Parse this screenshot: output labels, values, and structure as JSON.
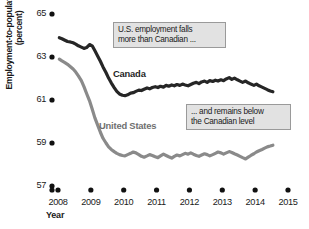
{
  "chart_data": {
    "type": "line",
    "title": "",
    "xlabel": "Year",
    "ylabel": "Employment-to-population ratio\n(percent)",
    "xlim": [
      2008.0,
      2015.0
    ],
    "ylim": [
      57,
      65
    ],
    "xticks": [
      "2008",
      "2009",
      "2010",
      "2011",
      "2012",
      "2013",
      "2014",
      "2015"
    ],
    "yticks": [
      "57",
      "59",
      "61",
      "63",
      "65"
    ],
    "grid": false,
    "legend_position": "inline-labels",
    "series": [
      {
        "name": "Canada",
        "color": "#262626",
        "label_position": "above-line",
        "x": [
          2008.04,
          2008.12,
          2008.21,
          2008.29,
          2008.37,
          2008.46,
          2008.54,
          2008.62,
          2008.71,
          2008.79,
          2008.87,
          2008.96,
          2009.04,
          2009.12,
          2009.21,
          2009.29,
          2009.37,
          2009.46,
          2009.54,
          2009.62,
          2009.71,
          2009.79,
          2009.87,
          2009.96,
          2010.04,
          2010.12,
          2010.21,
          2010.29,
          2010.37,
          2010.46,
          2010.54,
          2010.62,
          2010.71,
          2010.79,
          2010.87,
          2010.96,
          2011.04,
          2011.12,
          2011.21,
          2011.29,
          2011.37,
          2011.46,
          2011.54,
          2011.62,
          2011.71,
          2011.79,
          2011.87,
          2011.96,
          2012.04,
          2012.12,
          2012.21,
          2012.29,
          2012.37,
          2012.46,
          2012.54,
          2012.62,
          2012.71,
          2012.79,
          2012.87,
          2012.96,
          2013.04,
          2013.12,
          2013.21,
          2013.29,
          2013.37,
          2013.46,
          2013.54,
          2013.62,
          2013.71,
          2013.79,
          2013.87,
          2013.96,
          2014.04,
          2014.12,
          2014.21,
          2014.29,
          2014.37,
          2014.46,
          2014.54
        ],
        "values": [
          63.9,
          63.85,
          63.78,
          63.72,
          63.7,
          63.66,
          63.6,
          63.52,
          63.46,
          63.4,
          63.44,
          63.58,
          63.52,
          63.3,
          63.04,
          62.8,
          62.54,
          62.28,
          62.02,
          61.8,
          61.58,
          61.4,
          61.28,
          61.22,
          61.2,
          61.24,
          61.32,
          61.34,
          61.4,
          61.46,
          61.44,
          61.5,
          61.56,
          61.52,
          61.58,
          61.62,
          61.58,
          61.64,
          61.6,
          61.68,
          61.64,
          61.7,
          61.66,
          61.72,
          61.68,
          61.74,
          61.7,
          61.66,
          61.72,
          61.78,
          61.82,
          61.76,
          61.84,
          61.88,
          61.82,
          61.9,
          61.86,
          61.92,
          61.88,
          61.94,
          61.9,
          61.98,
          62.04,
          61.96,
          62.02,
          61.94,
          61.88,
          61.82,
          61.88,
          61.8,
          61.74,
          61.68,
          61.74,
          61.66,
          61.6,
          61.54,
          61.48,
          61.42,
          61.38
        ]
      },
      {
        "name": "United States",
        "color": "#8a8a8a",
        "label_position": "below-line",
        "x": [
          2008.04,
          2008.12,
          2008.21,
          2008.29,
          2008.37,
          2008.46,
          2008.54,
          2008.62,
          2008.71,
          2008.79,
          2008.87,
          2008.96,
          2009.04,
          2009.12,
          2009.21,
          2009.29,
          2009.37,
          2009.46,
          2009.54,
          2009.62,
          2009.71,
          2009.79,
          2009.87,
          2009.96,
          2010.04,
          2010.12,
          2010.21,
          2010.29,
          2010.37,
          2010.46,
          2010.54,
          2010.62,
          2010.71,
          2010.79,
          2010.87,
          2010.96,
          2011.04,
          2011.12,
          2011.21,
          2011.29,
          2011.37,
          2011.46,
          2011.54,
          2011.62,
          2011.71,
          2011.79,
          2011.87,
          2011.96,
          2012.04,
          2012.12,
          2012.21,
          2012.29,
          2012.37,
          2012.46,
          2012.54,
          2012.62,
          2012.71,
          2012.79,
          2012.87,
          2012.96,
          2013.04,
          2013.12,
          2013.21,
          2013.29,
          2013.37,
          2013.46,
          2013.54,
          2013.62,
          2013.71,
          2013.79,
          2013.87,
          2013.96,
          2014.04,
          2014.12,
          2014.21,
          2014.29,
          2014.37,
          2014.46,
          2014.54
        ],
        "values": [
          62.9,
          62.82,
          62.74,
          62.66,
          62.56,
          62.44,
          62.3,
          62.12,
          61.9,
          61.62,
          61.3,
          60.96,
          60.58,
          60.18,
          59.82,
          59.5,
          59.22,
          59.0,
          58.82,
          58.7,
          58.6,
          58.52,
          58.46,
          58.42,
          58.4,
          58.46,
          58.52,
          58.58,
          58.54,
          58.46,
          58.38,
          58.34,
          58.4,
          58.46,
          58.42,
          58.36,
          58.32,
          58.4,
          58.48,
          58.42,
          58.36,
          58.3,
          58.38,
          58.44,
          58.4,
          58.46,
          58.52,
          58.48,
          58.54,
          58.48,
          58.42,
          58.38,
          58.44,
          58.5,
          58.46,
          58.4,
          58.46,
          58.52,
          58.58,
          58.54,
          58.48,
          58.54,
          58.6,
          58.56,
          58.5,
          58.44,
          58.38,
          58.32,
          58.26,
          58.34,
          58.42,
          58.5,
          58.58,
          58.64,
          58.7,
          58.76,
          58.82,
          58.86,
          58.9
        ]
      }
    ],
    "annotations": [
      {
        "id": "callout-1",
        "text": "U.S. employment falls\nmore than Canadian ...",
        "fill": "#e2e2e2",
        "border": "#9a9a9a"
      },
      {
        "id": "callout-2",
        "text": "... and remains below\nthe Canadian level",
        "fill": "#e2e2e2",
        "border": "#9a9a9a"
      }
    ]
  }
}
